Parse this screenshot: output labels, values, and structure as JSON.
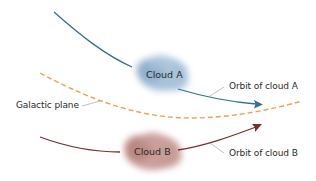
{
  "diagram": {
    "title": "",
    "clouds": [
      {
        "id": "A",
        "label": "Cloud A",
        "color": "#8fb0cc"
      },
      {
        "id": "B",
        "label": "Cloud B",
        "color": "#b47e78"
      }
    ],
    "labels": {
      "orbit_a": "Orbit of cloud A",
      "orbit_b": "Orbit of cloud B",
      "galactic_plane": "Galactic plane"
    },
    "colors": {
      "orbit_a": "#2e6f8a",
      "orbit_b": "#7a2e2e",
      "galactic_plane": "#f0a050",
      "leader_line": "#8a9aa6"
    }
  }
}
